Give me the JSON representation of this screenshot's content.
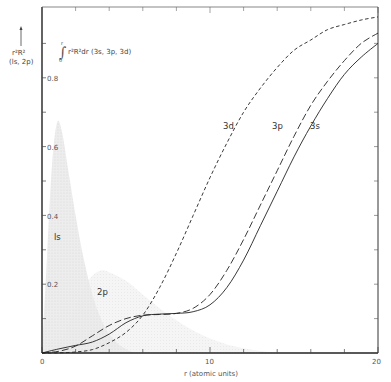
{
  "chart_data": {
    "type": "line",
    "title": "",
    "xlabel": "r (atomic units)",
    "ylabel": "r²R² (1s, 2p)",
    "ylabel2": "∫₀ʳ r²R²dr (3s, 3p, 3d)",
    "xlim": [
      0,
      20
    ],
    "ylim": [
      0,
      1.0
    ],
    "x_ticks": [
      0,
      10,
      20
    ],
    "x_tick_labels": [
      "0",
      "10",
      "20"
    ],
    "x_minor_ticks": [
      2,
      4,
      6,
      8,
      12,
      14,
      16,
      18
    ],
    "y_ticks": [
      0.2,
      0.4,
      0.6,
      0.8
    ],
    "y_tick_labels": [
      "0.2",
      "0.4",
      "0.6",
      "0.8"
    ],
    "y_minor_ticks": [
      0.1,
      0.3,
      0.5,
      0.7,
      0.9
    ],
    "grid": false,
    "legend": "inline labels",
    "shaded_distributions": [
      {
        "name": "1s",
        "label": "ls",
        "x": [
          0,
          0.3,
          0.6,
          0.9,
          1.2,
          1.6,
          2.0,
          2.5,
          3.0,
          3.5,
          4.0,
          4.5,
          5.0,
          5.5
        ],
        "values": [
          0,
          0.28,
          0.55,
          0.67,
          0.64,
          0.52,
          0.4,
          0.27,
          0.17,
          0.1,
          0.055,
          0.028,
          0.012,
          0
        ]
      },
      {
        "name": "2p",
        "label": "2p",
        "x": [
          0,
          1,
          1.5,
          2,
          2.5,
          3,
          3.5,
          4,
          5,
          6,
          7,
          8,
          9,
          10,
          11,
          12,
          13,
          14
        ],
        "values": [
          0,
          0.03,
          0.08,
          0.14,
          0.19,
          0.225,
          0.24,
          0.235,
          0.21,
          0.17,
          0.13,
          0.095,
          0.065,
          0.042,
          0.025,
          0.014,
          0.006,
          0
        ]
      }
    ],
    "series": [
      {
        "name": "3s",
        "label": "3s",
        "style": "solid",
        "x": [
          0,
          1,
          2,
          3,
          4,
          5,
          6,
          7,
          8,
          9,
          10,
          11,
          12,
          13,
          14,
          15,
          16,
          17,
          18,
          19,
          20
        ],
        "values": [
          0,
          0.012,
          0.022,
          0.032,
          0.055,
          0.088,
          0.108,
          0.113,
          0.115,
          0.12,
          0.14,
          0.19,
          0.27,
          0.37,
          0.47,
          0.57,
          0.66,
          0.74,
          0.81,
          0.86,
          0.9
        ]
      },
      {
        "name": "3p",
        "label": "3p",
        "style": "long-dash",
        "x": [
          0,
          1,
          2,
          3,
          4,
          5,
          6,
          7,
          8,
          9,
          10,
          11,
          12,
          13,
          14,
          15,
          16,
          17,
          18,
          19,
          20
        ],
        "values": [
          0,
          0.005,
          0.02,
          0.05,
          0.08,
          0.1,
          0.11,
          0.112,
          0.115,
          0.13,
          0.17,
          0.24,
          0.33,
          0.43,
          0.53,
          0.63,
          0.72,
          0.79,
          0.85,
          0.9,
          0.93
        ]
      },
      {
        "name": "3d",
        "label": "3d",
        "style": "short-dash",
        "x": [
          0,
          1,
          2,
          3,
          4,
          5,
          6,
          7,
          8,
          9,
          10,
          11,
          12,
          13,
          14,
          15,
          16,
          17,
          18,
          19,
          20
        ],
        "values": [
          0,
          0.0005,
          0.003,
          0.01,
          0.03,
          0.06,
          0.11,
          0.19,
          0.29,
          0.4,
          0.51,
          0.61,
          0.7,
          0.77,
          0.83,
          0.88,
          0.91,
          0.94,
          0.955,
          0.968,
          0.977
        ]
      }
    ]
  },
  "labels": {
    "y_arrow_top": "r²R²",
    "y_arrow_sub": "(ls, 2p)",
    "integral_text": "r²R²dr (3s, 3p, 3d)",
    "integral_upper": "r",
    "integral_lower": "0",
    "label_1s": "ls",
    "label_2p": "2p",
    "label_3s": "3s",
    "label_3p": "3p",
    "label_3d": "3d",
    "x_axis_title": "r (atomic units)",
    "x0": "0",
    "x10": "10",
    "x20": "20",
    "y02": "0.2",
    "y04": "0.4",
    "y06": "0.6",
    "y08": "0.8"
  }
}
